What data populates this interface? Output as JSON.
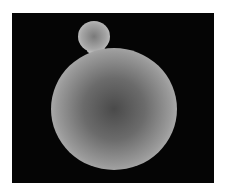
{
  "image": {
    "description": "Grayscale micrograph of a large sphere with a small attached sphere on a black background",
    "colors": {
      "background": "#050505",
      "border": "#ffffff",
      "sphere_edge": "#e0e0e0",
      "sphere_center": "#4a4a4a"
    }
  }
}
